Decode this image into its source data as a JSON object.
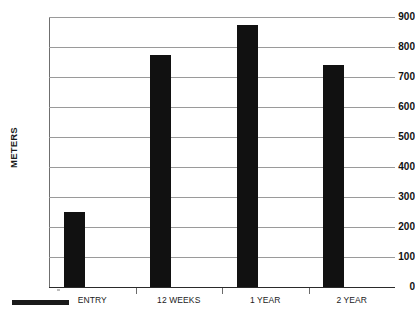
{
  "chart_data": {
    "type": "bar",
    "title": "",
    "xlabel": "",
    "ylabel": "METERS",
    "categories": [
      "ENTRY",
      "12 WEEKS",
      "1 YEAR",
      "2 YEAR"
    ],
    "values": [
      250,
      775,
      873,
      740
    ],
    "ylim": [
      0,
      900
    ],
    "ytick_step": 100,
    "yticks": [
      900,
      800,
      700,
      600,
      500,
      400,
      300,
      200,
      100,
      0
    ],
    "ytick_labels": [
      "900",
      "800",
      "700",
      "600",
      "500",
      "400",
      "300",
      "200",
      "100",
      "0"
    ],
    "grid": true,
    "grid_axis": "y",
    "legend": false,
    "bar_color": "#111111",
    "gridline_color": "#9a9a9a",
    "axis_color": "#2a2a2a",
    "background": "#ffffff"
  },
  "artifacts": {
    "scale_bar_present": true
  }
}
